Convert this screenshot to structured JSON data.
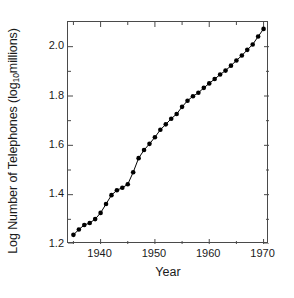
{
  "chart_data": {
    "type": "line",
    "title": "",
    "xlabel": "Year",
    "ylabel_parts": {
      "before": "Log Number of Telephones (log",
      "sub": "10",
      "after": " millions)"
    },
    "ylabel": "Log Number of Telephones (log10 millions)",
    "xlim": [
      1934,
      1971
    ],
    "ylim": [
      1.2,
      2.1
    ],
    "xticks": [
      1940,
      1950,
      1960,
      1970
    ],
    "xtick_labels": [
      "1940",
      "1950",
      "1960",
      "1970"
    ],
    "xminor_ticks": [
      1935,
      1945,
      1955,
      1965
    ],
    "yticks": [
      1.2,
      1.4,
      1.6,
      1.8,
      2.0
    ],
    "ytick_labels": [
      "1.2",
      "1.4",
      "1.6",
      "1.8",
      "2.0"
    ],
    "yminor_ticks": [
      1.3,
      1.5,
      1.7,
      1.9
    ],
    "grid": false,
    "legend": null,
    "marker": "filled-circle",
    "marker_color": "#000000",
    "line_color": "#000000",
    "x": [
      1935,
      1936,
      1937,
      1938,
      1939,
      1940,
      1941,
      1942,
      1943,
      1944,
      1945,
      1946,
      1947,
      1948,
      1949,
      1950,
      1951,
      1952,
      1953,
      1954,
      1955,
      1956,
      1957,
      1958,
      1959,
      1960,
      1961,
      1962,
      1963,
      1964,
      1965,
      1966,
      1967,
      1968,
      1969,
      1970
    ],
    "values": [
      1.237,
      1.259,
      1.277,
      1.285,
      1.301,
      1.326,
      1.362,
      1.398,
      1.418,
      1.428,
      1.442,
      1.491,
      1.548,
      1.581,
      1.606,
      1.633,
      1.663,
      1.685,
      1.708,
      1.727,
      1.756,
      1.781,
      1.799,
      1.813,
      1.833,
      1.851,
      1.869,
      1.887,
      1.903,
      1.923,
      1.944,
      1.964,
      1.987,
      2.009,
      2.041,
      2.072
    ]
  },
  "axes": {
    "xlabel": "Year",
    "ytick_labels": [
      "1.2",
      "1.4",
      "1.6",
      "1.8",
      "2.0"
    ],
    "xtick_labels": [
      "1940",
      "1950",
      "1960",
      "1970"
    ]
  }
}
